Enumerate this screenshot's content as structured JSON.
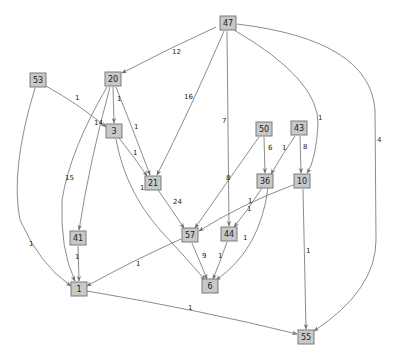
{
  "graph": {
    "type": "directed-weighted-graph",
    "colors": {
      "node_fill": "#c8c8c8",
      "node_stroke": "#7a7a7a",
      "edge": "#6e6e6e",
      "background": "#ffffff"
    },
    "nodes": [
      {
        "id": "47",
        "label": "47",
        "x": 228,
        "y": 23
      },
      {
        "id": "53",
        "label": "53",
        "x": 38,
        "y": 80
      },
      {
        "id": "20",
        "label": "20",
        "x": 113,
        "y": 79
      },
      {
        "id": "3",
        "label": "3",
        "x": 114,
        "y": 131
      },
      {
        "id": "21",
        "label": "21",
        "x": 153,
        "y": 183
      },
      {
        "id": "50",
        "label": "50",
        "x": 264,
        "y": 129
      },
      {
        "id": "43",
        "label": "43",
        "x": 299,
        "y": 128
      },
      {
        "id": "36",
        "label": "36",
        "x": 265,
        "y": 181
      },
      {
        "id": "10",
        "label": "10",
        "x": 302,
        "y": 181
      },
      {
        "id": "41",
        "label": "41",
        "x": 78,
        "y": 238
      },
      {
        "id": "57",
        "label": "57",
        "x": 190,
        "y": 235
      },
      {
        "id": "44",
        "label": "44",
        "x": 229,
        "y": 234
      },
      {
        "id": "1",
        "label": "1",
        "x": 79,
        "y": 289
      },
      {
        "id": "6",
        "label": "6",
        "x": 210,
        "y": 286
      },
      {
        "id": "55",
        "label": "55",
        "x": 306,
        "y": 337
      }
    ],
    "edges": [
      {
        "from": "47",
        "to": "20",
        "label": "12",
        "path": "M216,27 Q170,48 122,73",
        "lx": 172,
        "ly": 54
      },
      {
        "from": "47",
        "to": "21",
        "label": "16",
        "path": "M224,31 Q190,110 157,175",
        "lx": 184,
        "ly": 99
      },
      {
        "from": "47",
        "to": "44",
        "label": "7",
        "path": "M227,31 L229,226",
        "lx": 222,
        "ly": 123
      },
      {
        "from": "47",
        "to": "10",
        "label": "1",
        "path": "M234,30 Q320,80 318,125 Q316,160 307,173",
        "lx": 318,
        "ly": 120
      },
      {
        "from": "47",
        "to": "55",
        "label": "4",
        "path": "M237,24 Q370,40 375,110 L376,240 Q376,290 314,331",
        "lx": 377,
        "ly": 142
      },
      {
        "from": "53",
        "to": "3",
        "label": "1",
        "path": "M46,86 Q80,105 106,127",
        "lx": 75,
        "ly": 100
      },
      {
        "from": "53",
        "to": "1",
        "label": "1",
        "path": "M35,88 Q10,170 20,220 Q40,265 71,286",
        "lx": 29,
        "ly": 246
      },
      {
        "from": "20",
        "to": "3",
        "label": "1",
        "path": "M113,87 L114,123",
        "lx": 117,
        "ly": 101
      },
      {
        "from": "20",
        "to": "21",
        "label": "1",
        "path": "M116,87 Q135,135 150,175",
        "lx": 134,
        "ly": 129
      },
      {
        "from": "20",
        "to": "41",
        "label": "14",
        "path": "M110,87 Q90,160 79,230",
        "lx": 94,
        "ly": 125
      },
      {
        "from": "20",
        "to": "1",
        "label": "15",
        "path": "M107,87 Q70,150 62,200 Q60,250 75,281",
        "lx": 65,
        "ly": 180
      },
      {
        "from": "3",
        "to": "21",
        "label": "1",
        "path": "M119,138 Q135,158 147,176",
        "lx": 133,
        "ly": 155
      },
      {
        "from": "3",
        "to": "6",
        "label": "12",
        "path": "M116,139 Q125,190 160,230 Q190,262 205,280",
        "lx": 140,
        "ly": 190
      },
      {
        "from": "21",
        "to": "57",
        "label": "24",
        "path": "M158,190 Q172,210 184,228",
        "lx": 173,
        "ly": 204
      },
      {
        "from": "50",
        "to": "36",
        "label": "6",
        "path": "M264,137 L265,173",
        "lx": 268,
        "ly": 150
      },
      {
        "from": "50",
        "to": "57",
        "label": "8",
        "path": "M259,137 Q225,185 195,228",
        "lx": 226,
        "ly": 180
      },
      {
        "from": "43",
        "to": "36",
        "label": "1",
        "path": "M295,136 Q282,155 271,174",
        "lx": 282,
        "ly": 150
      },
      {
        "from": "43",
        "to": "10",
        "label": "8",
        "path": "M300,136 L301,173",
        "lx": 303,
        "ly": 149
      },
      {
        "from": "36",
        "to": "44",
        "label": "1",
        "path": "M262,188 Q248,210 234,227",
        "lx": 247,
        "ly": 211
      },
      {
        "from": "36",
        "to": "6",
        "label": "1",
        "path": "M268,188 Q260,250 216,280",
        "lx": 243,
        "ly": 240
      },
      {
        "from": "10",
        "to": "57",
        "label": "1",
        "path": "M293,185 Q240,205 199,231",
        "lx": 248,
        "ly": 203
      },
      {
        "from": "10",
        "to": "55",
        "label": "1",
        "path": "M303,189 L306,329",
        "lx": 306,
        "ly": 253
      },
      {
        "from": "41",
        "to": "1",
        "label": "1",
        "path": "M78,246 L79,281",
        "lx": 75,
        "ly": 259
      },
      {
        "from": "57",
        "to": "1",
        "label": "1",
        "path": "M181,239 Q130,262 87,286",
        "lx": 136,
        "ly": 266
      },
      {
        "from": "57",
        "to": "6",
        "label": "9",
        "path": "M192,243 Q200,262 207,279",
        "lx": 202,
        "ly": 258
      },
      {
        "from": "44",
        "to": "6",
        "label": "1",
        "path": "M227,242 Q220,262 213,279",
        "lx": 218,
        "ly": 258
      },
      {
        "from": "1",
        "to": "55",
        "label": "1",
        "path": "M87,291 Q200,310 297,334",
        "lx": 188,
        "ly": 310
      }
    ]
  }
}
